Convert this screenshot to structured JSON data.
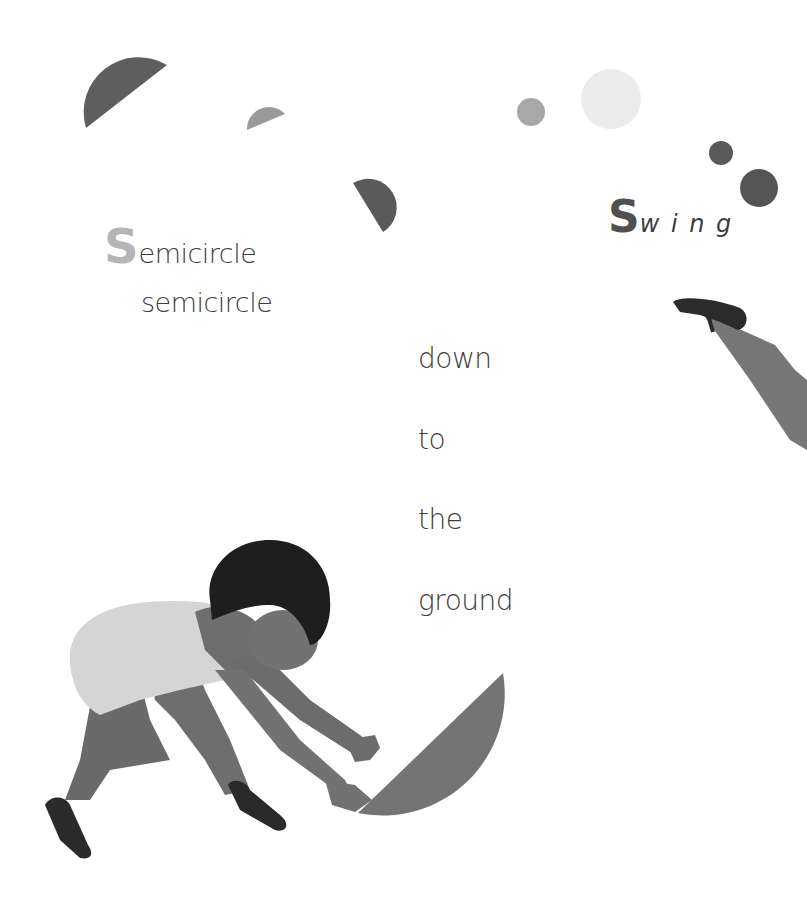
{
  "page": {
    "background": "#ffffff"
  },
  "poem": {
    "line1": {
      "initial": "S",
      "rest": "emicircle",
      "initial_color": "#b5b5b5"
    },
    "line2": "semicircle",
    "swing": {
      "initial": "S",
      "rest": "w i n g",
      "initial_color": "#505050"
    },
    "descent": [
      "down",
      "to",
      "the",
      "ground"
    ]
  },
  "shapes": {
    "colors": {
      "dark_gray": "#5e5e5e",
      "mid_gray": "#a3a3a3",
      "light_gray": "#ececec",
      "skin": "#6e6e6e",
      "leotard": "#d5d5d5",
      "hair": "#1e1e1e",
      "shoe": "#2a2a2a",
      "big_semicircle": "#747474"
    }
  }
}
